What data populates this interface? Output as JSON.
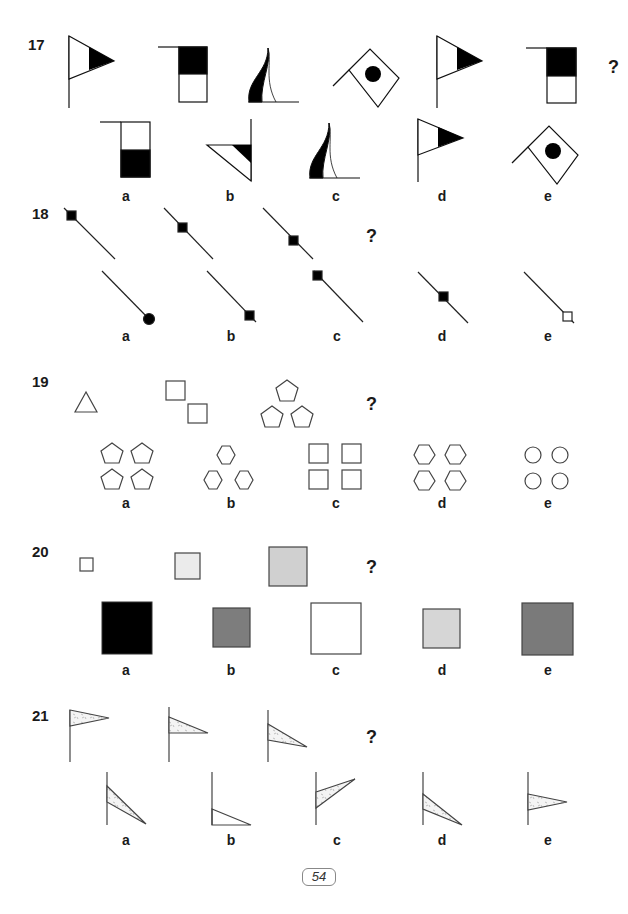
{
  "page": {
    "number": "54"
  },
  "questions": [
    {
      "number": "17",
      "prompt_mark": "?",
      "options": [
        "a",
        "b",
        "c",
        "d",
        "e"
      ],
      "sequence": [
        "pennant-right-black-tip",
        "square-flag-black-top",
        "flame-flag",
        "diamond-flag-black-dot",
        "pennant-right-black-tip",
        "square-flag-black-top"
      ],
      "choices": [
        "square-flag-black-bottom",
        "triangle-flag-left",
        "flame-flag",
        "pennant-right-black-tip",
        "diamond-flag-black-dot"
      ]
    },
    {
      "number": "18",
      "prompt_mark": "?",
      "options": [
        "a",
        "b",
        "c",
        "d",
        "e"
      ],
      "sequence": [
        "diagonal-line-square-at-start",
        "diagonal-line-square-quarter",
        "diagonal-line-square-middle"
      ],
      "choices": [
        "diagonal-line-circle-at-end",
        "diagonal-line-square-at-end",
        "diagonal-line-square-at-start",
        "diagonal-line-square-middle",
        "diagonal-line-hollow-square-at-end"
      ]
    },
    {
      "number": "19",
      "prompt_mark": "?",
      "options": [
        "a",
        "b",
        "c",
        "d",
        "e"
      ],
      "sequence": [
        "one-triangle",
        "two-squares",
        "three-pentagons"
      ],
      "choices": [
        "four-pentagons",
        "three-hexagons",
        "four-squares",
        "four-hexagons",
        "four-circles"
      ]
    },
    {
      "number": "20",
      "prompt_mark": "?",
      "options": [
        "a",
        "b",
        "c",
        "d",
        "e"
      ],
      "sequence": [
        "small-white-square",
        "medium-light-grey-square",
        "large-grey-square"
      ],
      "choices": [
        "largest-black-square",
        "small-dark-grey-square",
        "large-white-square",
        "small-light-grey-square",
        "largest-dark-grey-square"
      ],
      "colors": {
        "white": "#ffffff",
        "light": "#ebebeb",
        "mid": "#d0d0d0",
        "dark": "#808080",
        "darker": "#7a7a7a",
        "black": "#000000"
      }
    },
    {
      "number": "21",
      "prompt_mark": "?",
      "options": [
        "a",
        "b",
        "c",
        "d",
        "e"
      ],
      "sequence": [
        "pennant-top",
        "pennant-lowered",
        "pennant-lowered-more"
      ],
      "choices": [
        "pennant-drooping",
        "pennant-outline-bottom",
        "pennant-raised",
        "pennant-drooping-dotted",
        "pennant-mid"
      ]
    }
  ]
}
